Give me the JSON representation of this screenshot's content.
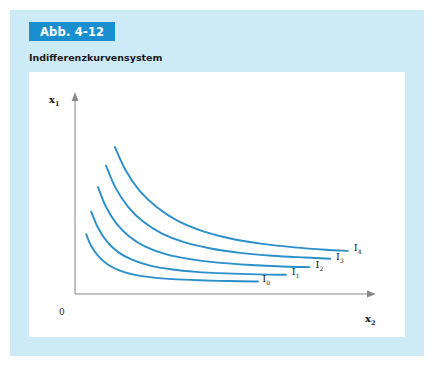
{
  "figure": {
    "badge": "Abb. 4-12",
    "title": "Indifferenzkurvensystem",
    "badge_color": "#1a8fd0",
    "panel_color": "#cdeaf7",
    "card_color": "#ffffff"
  },
  "chart_data": {
    "type": "line",
    "title": "Indifferenzkurvensystem",
    "xlabel": "x",
    "xlabel_sub": "2",
    "ylabel": "x",
    "ylabel_sub": "1",
    "origin_label": "0",
    "grid": false,
    "legend_position": "inline-right",
    "axis_color": "#8a8a8a",
    "curve_color": "#2b8fc9",
    "xlim": [
      0,
      10
    ],
    "ylim": [
      0,
      10
    ],
    "series": [
      {
        "name": "I",
        "name_sub": "0",
        "utility_constant": 1.15,
        "label_x": 6.35,
        "label_y": 0.62,
        "x": [
          0.38,
          0.55,
          0.8,
          1.1,
          1.5,
          2.0,
          2.6,
          3.3,
          4.2,
          5.2,
          6.2
        ],
        "y": [
          3.05,
          2.45,
          1.92,
          1.52,
          1.21,
          0.99,
          0.85,
          0.76,
          0.7,
          0.66,
          0.64
        ]
      },
      {
        "name": "I",
        "name_sub": "1",
        "utility_constant": 1.85,
        "label_x": 7.35,
        "label_y": 0.96,
        "x": [
          0.55,
          0.78,
          1.08,
          1.45,
          1.95,
          2.55,
          3.25,
          4.1,
          5.1,
          6.2,
          7.15
        ],
        "y": [
          4.2,
          3.38,
          2.68,
          2.15,
          1.74,
          1.45,
          1.26,
          1.13,
          1.05,
          1.0,
          0.98
        ]
      },
      {
        "name": "I",
        "name_sub": "2",
        "utility_constant": 2.7,
        "label_x": 8.15,
        "label_y": 1.33,
        "x": [
          0.78,
          1.05,
          1.4,
          1.85,
          2.4,
          3.1,
          3.9,
          4.85,
          5.95,
          7.05,
          7.95
        ],
        "y": [
          5.45,
          4.45,
          3.6,
          2.92,
          2.4,
          2.02,
          1.78,
          1.6,
          1.48,
          1.4,
          1.37
        ]
      },
      {
        "name": "I",
        "name_sub": "3",
        "utility_constant": 3.7,
        "label_x": 8.85,
        "label_y": 1.72,
        "x": [
          1.05,
          1.38,
          1.8,
          2.32,
          2.95,
          3.72,
          4.6,
          5.6,
          6.7,
          7.8,
          8.65
        ],
        "y": [
          6.55,
          5.4,
          4.45,
          3.68,
          3.08,
          2.63,
          2.32,
          2.1,
          1.95,
          1.86,
          1.8
        ]
      },
      {
        "name": "I",
        "name_sub": "4",
        "utility_constant": 4.9,
        "label_x": 9.45,
        "label_y": 2.18,
        "x": [
          1.35,
          1.72,
          2.2,
          2.8,
          3.5,
          4.35,
          5.3,
          6.35,
          7.45,
          8.5,
          9.25
        ],
        "y": [
          7.5,
          6.3,
          5.25,
          4.4,
          3.72,
          3.2,
          2.82,
          2.56,
          2.38,
          2.26,
          2.2
        ]
      }
    ]
  }
}
